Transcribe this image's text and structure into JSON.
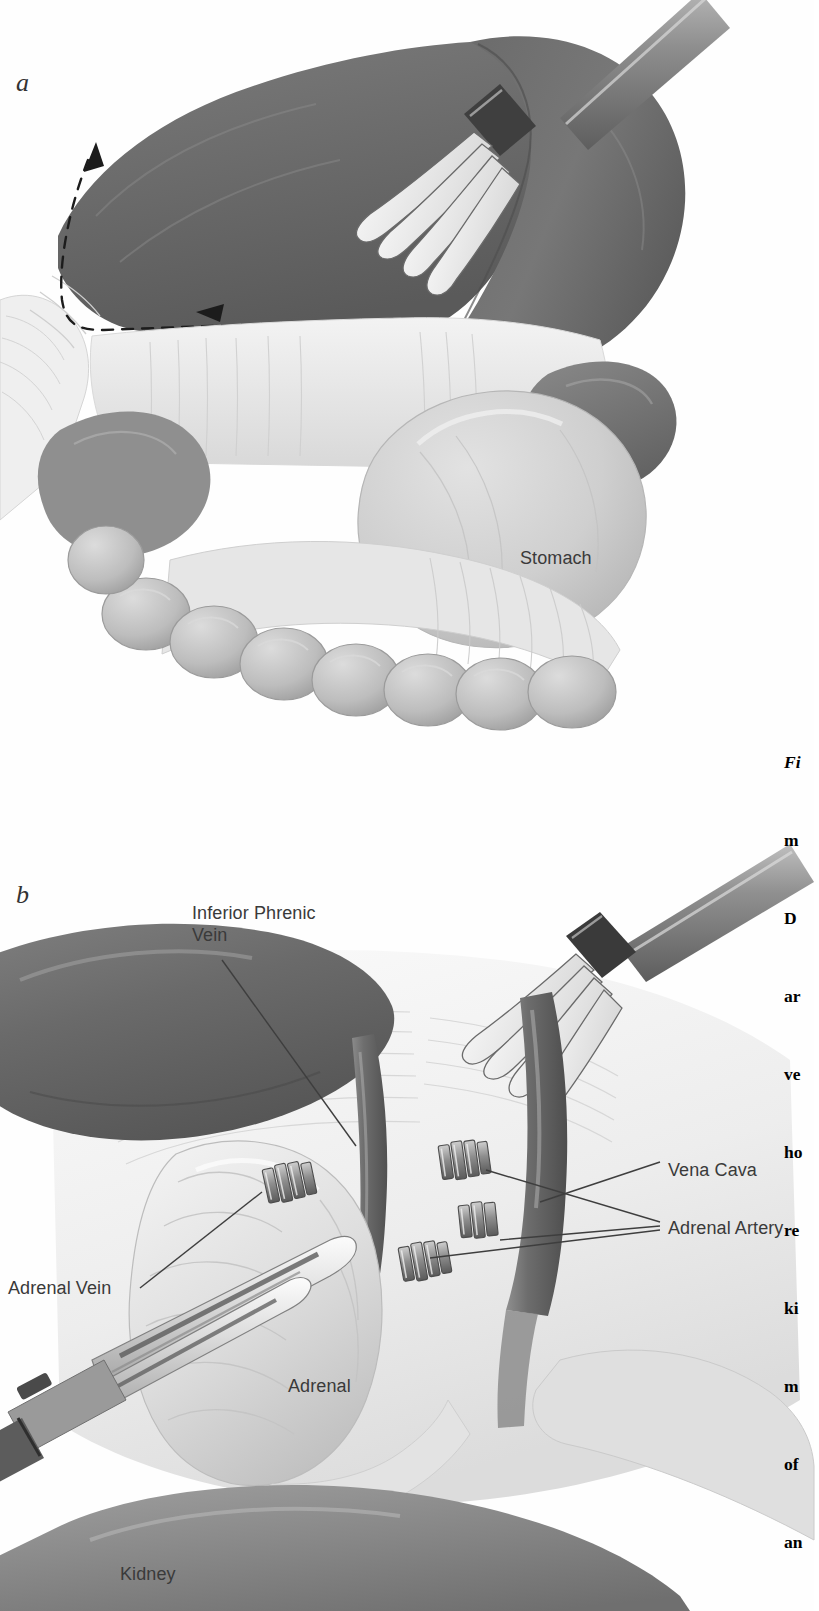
{
  "figure": {
    "type": "medical-surgical-illustration",
    "style": "grayscale pen-and-ink / airbrush anatomical drawing",
    "procedure": "Laparoscopic left adrenalectomy exposure",
    "panels": [
      {
        "letter": "a",
        "description": "Liver retracted superiorly with laparoscopic fan retractor; dashed arrow indicates direction of mobilization along the inferior liver edge.",
        "labels": [
          {
            "text": "Stomach",
            "x": 520,
            "y": 548
          }
        ]
      },
      {
        "letter": "b",
        "description": "Exposed adrenal gland with vessels clipped; laparoscopic clip applier and dissector in the field.",
        "labels": [
          {
            "text": "Inferior Phrenic\nVein",
            "x": 192,
            "y": 903
          },
          {
            "text": "Vena Cava",
            "x": 668,
            "y": 1160
          },
          {
            "text": "Adrenal Artery",
            "x": 668,
            "y": 1218
          },
          {
            "text": "Adrenal Vein",
            "x": 8,
            "y": 1278
          },
          {
            "text": "Adrenal",
            "x": 288,
            "y": 1376
          },
          {
            "text": "Kidney",
            "x": 120,
            "y": 1564
          }
        ]
      }
    ],
    "caption_lines": [
      "Fi",
      "m",
      "D",
      "ar",
      "ve",
      "ho",
      "re",
      "ki",
      "m",
      "of",
      "an"
    ],
    "caption_note": "Caption column is cropped at the right page margin; only the first characters of each line are visible.",
    "colors": {
      "liver": "#6f6f6f",
      "liver_dark": "#565656",
      "stomach": "#c9c9c9",
      "bowel": "#b5b5b5",
      "fascia": "#ececec",
      "vessel": "#8a8a8a",
      "instrument": "#9a9a9a",
      "clip": "#7a7a7a",
      "label_text": "#3a3a3a",
      "leader_line": "#4a4a4a",
      "background": "#ffffff"
    }
  }
}
